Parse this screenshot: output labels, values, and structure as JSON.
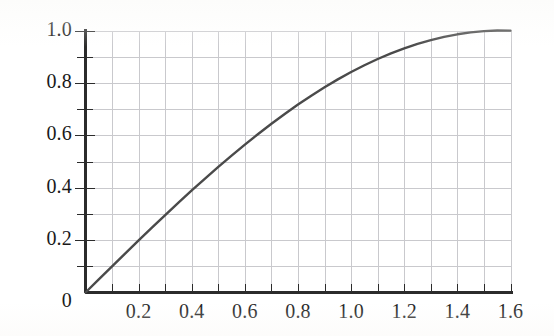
{
  "figure": {
    "background_color": "#ffffff",
    "axis_color": "#2b2b2b",
    "grid_color": "#c9c9cd",
    "curve_color": "#4a4a4a",
    "label_color": "#191919"
  },
  "chart_data": {
    "type": "line",
    "title": "",
    "subtitle": "",
    "xlabel": "",
    "ylabel": "",
    "xlim": [
      0,
      1.6
    ],
    "ylim": [
      0,
      1.0
    ],
    "grid": true,
    "grid_step_x": 0.1,
    "grid_step_y": 0.1,
    "legend": null,
    "legend_position": "none",
    "x_major_ticks": [
      0,
      0.2,
      0.4,
      0.6,
      0.8,
      1.0,
      1.2,
      1.4,
      1.6
    ],
    "x_tick_labels": [
      "0",
      "0.2",
      "0.4",
      "0.6",
      "0.8",
      "1.0",
      "1.2",
      "1.4",
      "1.6"
    ],
    "x_minor_ticks": [
      0.1,
      0.3,
      0.5,
      0.7,
      0.9,
      1.1,
      1.3,
      1.5
    ],
    "y_major_ticks": [
      0,
      0.2,
      0.4,
      0.6,
      0.8,
      1.0
    ],
    "y_tick_labels": [
      "0",
      "0.2",
      "0.4",
      "0.6",
      "0.8",
      "1.0"
    ],
    "y_minor_ticks": [
      0.1,
      0.3,
      0.5,
      0.7,
      0.9
    ],
    "series": [
      {
        "name": "sin(x)",
        "x": [
          0.0,
          0.05,
          0.1,
          0.15,
          0.2,
          0.25,
          0.3,
          0.35,
          0.4,
          0.45,
          0.5,
          0.55,
          0.6,
          0.65,
          0.7,
          0.75,
          0.8,
          0.85,
          0.9,
          0.95,
          1.0,
          1.05,
          1.1,
          1.15,
          1.2,
          1.25,
          1.3,
          1.35,
          1.4,
          1.45,
          1.5,
          1.55,
          1.6
        ],
        "values": [
          0.0,
          0.04998,
          0.09983,
          0.14944,
          0.19867,
          0.2474,
          0.29552,
          0.3429,
          0.38942,
          0.43497,
          0.47943,
          0.52269,
          0.56464,
          0.60519,
          0.64422,
          0.68164,
          0.71736,
          0.75128,
          0.78333,
          0.81342,
          0.84147,
          0.86742,
          0.89121,
          0.91276,
          0.93204,
          0.94898,
          0.96356,
          0.97572,
          0.98545,
          0.99271,
          0.99749,
          0.99978,
          0.99957
        ]
      }
    ]
  },
  "axes": {
    "x_axis_name": "x-axis",
    "y_axis_name": "y-axis"
  }
}
